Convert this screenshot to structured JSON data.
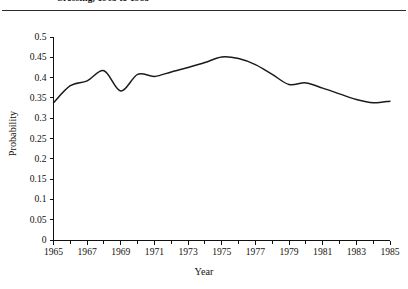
{
  "figure": {
    "title": "Crossing, 1965 to 1985",
    "background": "#ffffff",
    "line_color": "#1a1a1a",
    "axis_color": "#111111"
  },
  "axis_titles": {
    "y": "Probability",
    "x": "Year"
  },
  "chart_data": {
    "type": "line",
    "title": "Crossing, 1965 to 1985",
    "xlabel": "Year",
    "ylabel": "Probability",
    "xlim": [
      1965,
      1985
    ],
    "ylim": [
      0,
      0.5
    ],
    "grid": false,
    "legend": null,
    "xticks": [
      1965,
      1966,
      1967,
      1968,
      1969,
      1970,
      1971,
      1972,
      1973,
      1974,
      1975,
      1976,
      1977,
      1978,
      1979,
      1980,
      1981,
      1982,
      1983,
      1984,
      1985
    ],
    "xtick_labels": [
      "1965",
      "",
      "1967",
      "",
      "1969",
      "",
      "1971",
      "",
      "1973",
      "",
      "1975",
      "",
      "1977",
      "",
      "1979",
      "",
      "1981",
      "",
      "1983",
      "",
      "1985"
    ],
    "yticks": [
      0,
      0.05,
      0.1,
      0.15,
      0.2,
      0.25,
      0.3,
      0.35,
      0.4,
      0.45,
      0.5
    ],
    "ytick_labels": [
      "0",
      "0.05",
      "0.1",
      "0.15",
      "0.2",
      "0.25",
      "0.3",
      "0.35",
      "0.4",
      "0.45",
      "0.5"
    ],
    "series": [
      {
        "name": "Probability of crossing",
        "x": [
          1965,
          1966,
          1967,
          1968,
          1969,
          1970,
          1971,
          1972,
          1973,
          1974,
          1975,
          1976,
          1977,
          1978,
          1979,
          1980,
          1981,
          1982,
          1983,
          1984,
          1985
        ],
        "values": [
          0.338,
          0.38,
          0.392,
          0.417,
          0.367,
          0.408,
          0.403,
          0.414,
          0.425,
          0.437,
          0.451,
          0.447,
          0.432,
          0.408,
          0.383,
          0.387,
          0.374,
          0.36,
          0.346,
          0.338,
          0.342
        ]
      }
    ]
  }
}
